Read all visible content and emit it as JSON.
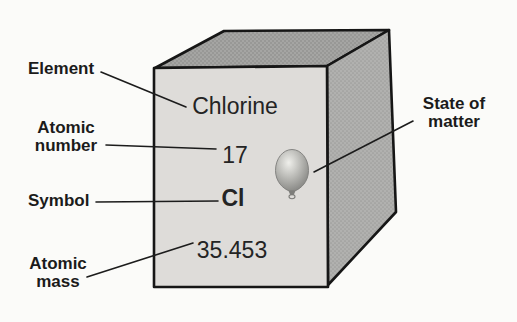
{
  "diagram_title": "element-cube-diagram",
  "labels": {
    "element": "Element",
    "atomic_number": "Atomic number",
    "symbol": "Symbol",
    "atomic_mass": "Atomic mass",
    "state_of_matter": "State of matter"
  },
  "values": {
    "element_name": "Chlorine",
    "atomic_number": "17",
    "symbol": "Cl",
    "atomic_mass": "35.453"
  },
  "icons": {
    "state_of_matter": "balloon-icon"
  },
  "colors": {
    "background": "#fbfbf9",
    "front_face": "#dedcd9",
    "top_face": "#a5a5a3",
    "top_face_dot": "#929290",
    "side_face": "#b1b1af",
    "side_face_dot": "#9d9d9b",
    "outline": "#161616",
    "leader_line": "#1c1c1c",
    "text": "#1b1b1b",
    "balloon_highlight": "#efefeb",
    "balloon_mid": "#b6b6b2",
    "balloon_dark": "#7d7d7a"
  }
}
